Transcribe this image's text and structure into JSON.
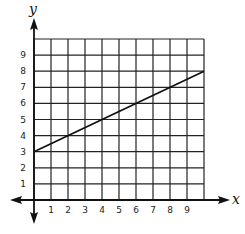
{
  "chart_data": {
    "type": "line",
    "title": "",
    "xlabel": "x",
    "ylabel": "y",
    "xlim": [
      0,
      10
    ],
    "ylim": [
      0,
      10
    ],
    "grid": true,
    "x_ticks": [
      "1",
      "2",
      "3",
      "4",
      "5",
      "6",
      "7",
      "8",
      "9"
    ],
    "y_ticks": [
      "1",
      "2",
      "3",
      "4",
      "5",
      "6",
      "7",
      "8",
      "9"
    ],
    "series": [
      {
        "name": "line",
        "x": [
          0,
          10
        ],
        "y": [
          3,
          8
        ],
        "color": "#111111"
      }
    ]
  },
  "colors": {
    "grid": "#222222",
    "axis": "#111111",
    "line": "#111111"
  }
}
